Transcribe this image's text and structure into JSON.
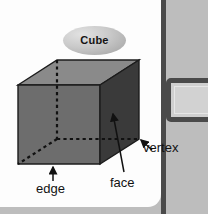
{
  "figure": {
    "title": "Cube",
    "kind": "3d-cube-diagram"
  },
  "labels": {
    "vertex": "vertex",
    "face": "face",
    "edge": "edge"
  },
  "colors": {
    "page_background": "#fdfdfd",
    "gutter": "#bdbdbd",
    "rule": "#4a4a4a",
    "cube_top_face": "#8a8a8a",
    "cube_front_face": "#6d6d6d",
    "cube_right_face": "#3a3a3a",
    "outline": "#1c1c1c",
    "text": "#121212",
    "callout_fill": "#d2d2d2",
    "callout_border": "#4a4a4a"
  },
  "cube_geometry": {
    "front_face": [
      [
        18,
        85
      ],
      [
        18,
        164
      ],
      [
        100,
        164
      ],
      [
        100,
        85
      ]
    ],
    "top_face": [
      [
        18,
        85
      ],
      [
        57,
        60
      ],
      [
        139,
        60
      ],
      [
        100,
        85
      ]
    ],
    "right_face": [
      [
        100,
        85
      ],
      [
        139,
        60
      ],
      [
        139,
        139
      ],
      [
        100,
        164
      ]
    ],
    "hidden_vertex": [
      57,
      139
    ],
    "hidden_edges": [
      {
        "from": [
          57,
          60
        ],
        "to": [
          57,
          139
        ]
      },
      {
        "from": [
          57,
          139
        ],
        "to": [
          139,
          139
        ]
      },
      {
        "from": [
          57,
          139
        ],
        "to": [
          18,
          164
        ]
      }
    ]
  },
  "annotations": [
    {
      "name": "vertex",
      "target": [
        139,
        139
      ],
      "leader_from": [
        152,
        150
      ]
    },
    {
      "name": "face",
      "target": [
        112,
        115
      ],
      "leader_from": [
        124,
        172
      ]
    },
    {
      "name": "edge",
      "target": [
        53,
        165
      ],
      "leader_from": [
        53,
        180
      ]
    }
  ]
}
